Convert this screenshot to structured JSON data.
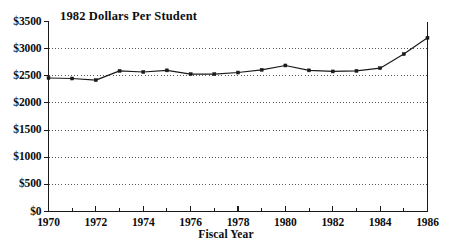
{
  "chart_data": {
    "type": "line",
    "title": "1982 Dollars Per Student",
    "xlabel": "Fiscal Year",
    "ylabel": "",
    "x": [
      1970,
      1971,
      1972,
      1973,
      1974,
      1975,
      1976,
      1977,
      1978,
      1979,
      1980,
      1981,
      1982,
      1983,
      1984,
      1985,
      1986
    ],
    "values": [
      2460,
      2450,
      2420,
      2590,
      2570,
      2600,
      2530,
      2530,
      2560,
      2610,
      2690,
      2600,
      2580,
      2590,
      2640,
      2900,
      3200
    ],
    "series": [
      {
        "name": "1982 Dollars Per Student",
        "values": [
          2460,
          2450,
          2420,
          2590,
          2570,
          2600,
          2530,
          2530,
          2560,
          2610,
          2690,
          2600,
          2580,
          2590,
          2640,
          2900,
          3200
        ]
      }
    ],
    "ylim": [
      0,
      3500
    ],
    "xlim": [
      1970,
      1986
    ],
    "ytick_labels": [
      "$0",
      "$500",
      "$1000",
      "$1500",
      "$2000",
      "$2500",
      "$3000",
      "$3500"
    ],
    "ytick_values": [
      0,
      500,
      1000,
      1500,
      2000,
      2500,
      3000,
      3500
    ],
    "xtick_labels": [
      "1970",
      "1972",
      "1974",
      "1976",
      "1978",
      "1980",
      "1982",
      "1984",
      "1986"
    ],
    "xtick_values": [
      1970,
      1972,
      1974,
      1976,
      1978,
      1980,
      1982,
      1984,
      1986
    ],
    "xminor_values": [
      1971,
      1973,
      1975,
      1977,
      1979,
      1981,
      1983,
      1985
    ],
    "grid": "horizontal-dotted",
    "legend": "none",
    "line_color": "#1a1a1a",
    "marker": "square",
    "marker_color": "#1a1a1a",
    "axis_color": "#1a1a1a",
    "grid_color": "#555555",
    "background": "#ffffff"
  }
}
